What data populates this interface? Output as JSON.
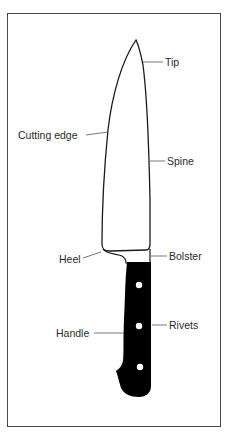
{
  "diagram": {
    "labels": {
      "tip": "Tip",
      "cutting_edge": "Cutting edge",
      "spine": "Spine",
      "heel": "Heel",
      "bolster": "Bolster",
      "handle": "Handle",
      "rivets": "Rivets"
    },
    "colors": {
      "outline": "#1a1a1a",
      "handle": "#000000",
      "frame": "#4a4a4a",
      "text": "#2a2a2a"
    }
  }
}
